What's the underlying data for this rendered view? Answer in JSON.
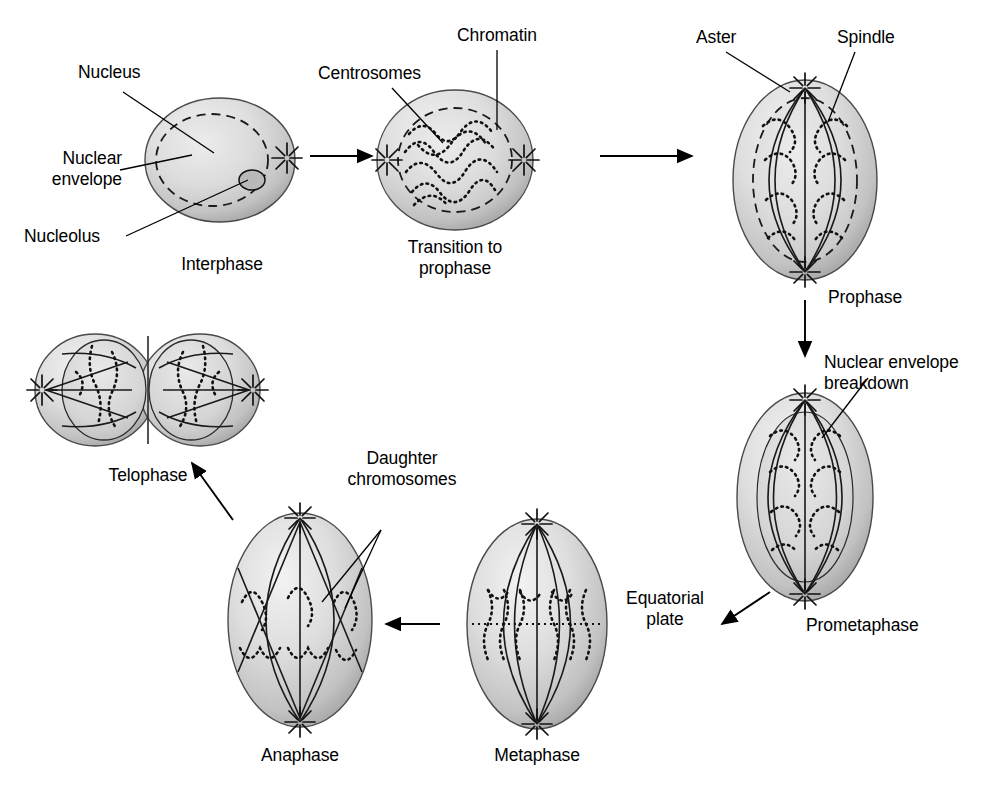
{
  "diagram": {
    "type": "biological-process-cycle",
    "background_color": "#ffffff",
    "ink_color": "#000000",
    "cell_fill_light": "#eeeeee",
    "cell_fill_mid": "#d8d8d8",
    "cell_fill_dark": "#a8a8a8",
    "nucleus_fill": "#e4e4e4"
  },
  "stages": [
    {
      "id": "interphase",
      "caption": "Interphase"
    },
    {
      "id": "transition",
      "caption": "Transition to\nprophase",
      "caption_line1": "Transition to",
      "caption_line2": "prophase"
    },
    {
      "id": "prophase",
      "caption": "Prophase"
    },
    {
      "id": "prometaphase",
      "caption": "Prometaphase"
    },
    {
      "id": "metaphase",
      "caption": "Metaphase"
    },
    {
      "id": "anaphase",
      "caption": "Anaphase"
    },
    {
      "id": "telophase",
      "caption": "Telophase"
    }
  ],
  "labels": {
    "nucleus": "Nucleus",
    "nuclear_envelope_l1": "Nuclear",
    "nuclear_envelope_l2": "envelope",
    "nucleolus": "Nucleolus",
    "centrosomes": "Centrosomes",
    "chromatin": "Chromatin",
    "aster": "Aster",
    "spindle": "Spindle",
    "nuclear_envelope_breakdown_l1": "Nuclear envelope",
    "nuclear_envelope_breakdown_l2": "breakdown",
    "equatorial_plate_l1": "Equatorial",
    "equatorial_plate_l2": "plate",
    "daughter_chromosomes_l1": "Daughter",
    "daughter_chromosomes_l2": "chromosomes"
  },
  "flow": [
    {
      "from": "interphase",
      "to": "transition",
      "direction": "right"
    },
    {
      "from": "transition",
      "to": "prophase",
      "direction": "right"
    },
    {
      "from": "prophase",
      "to": "prometaphase",
      "direction": "down"
    },
    {
      "from": "prometaphase",
      "to": "metaphase",
      "direction": "left-diagonal"
    },
    {
      "from": "metaphase",
      "to": "anaphase",
      "direction": "left"
    },
    {
      "from": "anaphase",
      "to": "telophase",
      "direction": "up-left-diagonal"
    }
  ]
}
